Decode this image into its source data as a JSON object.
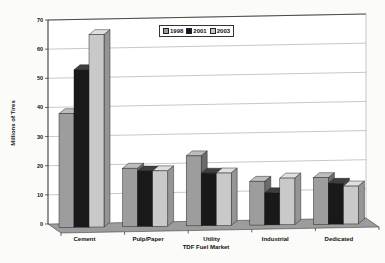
{
  "chart_data": {
    "type": "bar",
    "style": "3d-column",
    "title": "",
    "categories": [
      "Cement",
      "Pulp/Paper",
      "Utility",
      "Industrial",
      "Dedicated"
    ],
    "series": [
      {
        "name": "1998",
        "values": [
          39,
          20,
          24,
          15,
          16
        ],
        "color": "#9d9d9d",
        "top": "#bcbcbc",
        "side": "#6b6b6b"
      },
      {
        "name": "2001",
        "values": [
          54,
          19,
          18,
          11,
          14
        ],
        "color": "#191919",
        "top": "#3f3f3f",
        "side": "#4a4a4a"
      },
      {
        "name": "2003",
        "values": [
          66,
          19,
          18,
          16,
          13
        ],
        "color": "#c9c9c9",
        "top": "#dfdfdf",
        "side": "#959595"
      }
    ],
    "xlabel": "TDF Fuel Market",
    "ylabel": "Millions of Tires",
    "ylim": [
      0,
      70
    ],
    "yticks": [
      0,
      10,
      20,
      30,
      40,
      50,
      60,
      70
    ],
    "grid": true,
    "legend_position": "top-center",
    "colors": {
      "background": "#fbfbf9",
      "wall": "#ffffff",
      "floor": "#9c9c9c",
      "gridline": "#b0b0b0",
      "axis": "#2a2a2a",
      "bar_outline": "#1a1a1a",
      "text": "#111111"
    }
  }
}
